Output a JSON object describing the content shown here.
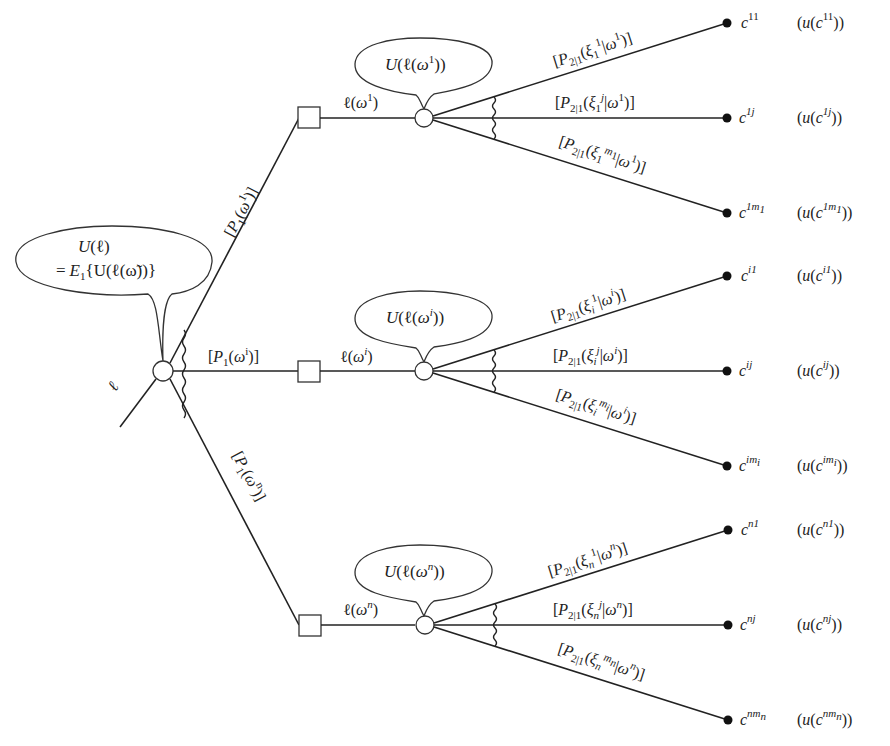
{
  "diagram": {
    "type": "decision-tree",
    "root": {
      "lottery_label": "ℓ",
      "bubble_line1": "U(ℓ)",
      "bubble_line2": "= E₁{U(ℓ(ω̃))}"
    },
    "first_stage_branches": [
      {
        "id": "1",
        "prob_label": "[P₁(ω¹)]",
        "lottery_label": "ℓ(ω¹)",
        "bubble": "U(ℓ(ω¹))",
        "outcomes": [
          {
            "prob_label": "[P₂|₁(ξ₁¹|ω¹)]",
            "consequence": "c¹¹",
            "utility": "(u(c¹¹))"
          },
          {
            "prob_label": "[P₂|₁(ξ₁ʲ|ω¹)]",
            "consequence": "c¹ʲ",
            "utility": "(u(c¹ʲ))"
          },
          {
            "prob_label": "[P₂|₁(ξ₁^m₁|ω¹)]",
            "consequence": "c^1m₁",
            "utility": "(u(c^1m₁))"
          }
        ]
      },
      {
        "id": "i",
        "prob_label": "[P₁(ωⁱ)]",
        "lottery_label": "ℓ(ωⁱ)",
        "bubble": "U(ℓ(ωⁱ))",
        "outcomes": [
          {
            "prob_label": "[P₂|₁(ξᵢ¹|ωⁱ)]",
            "consequence": "cⁱ¹",
            "utility": "(u(cⁱ¹))"
          },
          {
            "prob_label": "[P₂|₁(ξᵢʲ|ωⁱ)]",
            "consequence": "cⁱʲ",
            "utility": "(u(cⁱʲ))"
          },
          {
            "prob_label": "[P₂|₁(ξᵢ^mᵢ|ωⁱ)]",
            "consequence": "c^imᵢ",
            "utility": "(u(c^imᵢ))"
          }
        ]
      },
      {
        "id": "n",
        "prob_label": "[P₁(ωⁿ)]",
        "lottery_label": "ℓ(ωⁿ)",
        "bubble": "U(ℓ(ωⁿ))",
        "outcomes": [
          {
            "prob_label": "[P₂|₁(ξₙ¹|ωⁿ)]",
            "consequence": "cⁿ¹",
            "utility": "(u(cⁿ¹))"
          },
          {
            "prob_label": "[P₂|₁(ξₙʲ|ωⁿ)]",
            "consequence": "cⁿʲ",
            "utility": "(u(cⁿʲ))"
          },
          {
            "prob_label": "[P₂|₁(ξₙ^mₙ|ωⁿ)]",
            "consequence": "c^nmₙ",
            "utility": "(u(c^nmₙ))"
          }
        ]
      }
    ],
    "text": {
      "root_ell": "ℓ",
      "root_b1_U": "U",
      "root_b1_rest": "(ℓ)",
      "root_b2_eq": "=",
      "root_b2_E": "E",
      "root_b2_sub": "1",
      "root_b2_rest": "{U(ℓ(ω̃))}",
      "P": "P",
      "one": "1",
      "two_one": "2|1",
      "omega": "ω",
      "xi": "ξ",
      "c": "c",
      "u": "u",
      "sup_1": "1",
      "sup_i": "i",
      "sup_n": "n",
      "sup_j": "j",
      "sub_1": "1",
      "sub_i": "i",
      "sub_n": "n",
      "sup_m1": "m",
      "sup_11": "11",
      "sup_1j": "1j",
      "sup_1m": "1m",
      "sup_i1": "i1",
      "sup_ij": "ij",
      "sup_im": "im",
      "sup_n1": "n1",
      "sup_nj": "nj",
      "sup_nm": "nm",
      "lbr": "[",
      "rbr": ")]",
      "open": "(",
      "bar": "|",
      "close1": ")",
      "close2": "))",
      "ell": "ℓ",
      "U": "U"
    }
  }
}
